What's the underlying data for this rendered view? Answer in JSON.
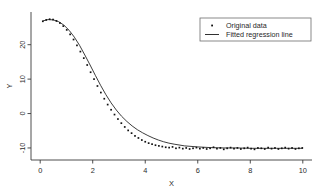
{
  "chart_data": {
    "type": "scatter",
    "title": "",
    "subtitle": "",
    "xlabel": "X",
    "ylabel": "Y",
    "xlim": [
      -0.35,
      10.35
    ],
    "ylim": [
      -13.5,
      29.5
    ],
    "xticks": [
      0,
      2,
      4,
      6,
      8,
      10
    ],
    "xticklabels": [
      "0",
      "2",
      "4",
      "6",
      "8",
      "10"
    ],
    "yticks": [
      -10,
      0,
      10,
      20
    ],
    "yticklabels": [
      "-10",
      "0",
      "10",
      "20"
    ],
    "grid": false,
    "legend_position": "top-right",
    "legend": [
      "Original data",
      "Fitted regression line"
    ],
    "series": [
      {
        "name": "Original data",
        "type": "scatter",
        "marker": "dot",
        "color": "#111111",
        "x": [
          0.1,
          0.23,
          0.36,
          0.49,
          0.62,
          0.75,
          0.88,
          1.01,
          1.14,
          1.27,
          1.4,
          1.53,
          1.66,
          1.79,
          1.92,
          2.05,
          2.18,
          2.31,
          2.44,
          2.57,
          2.7,
          2.83,
          2.96,
          3.09,
          3.22,
          3.35,
          3.48,
          3.61,
          3.74,
          3.87,
          4.0,
          4.13,
          4.26,
          4.39,
          4.52,
          4.65,
          4.78,
          4.91,
          5.04,
          5.17,
          5.3,
          5.43,
          5.56,
          5.69,
          5.82,
          5.95,
          6.08,
          6.21,
          6.34,
          6.47,
          6.6,
          6.73,
          6.86,
          6.99,
          7.12,
          7.25,
          7.38,
          7.51,
          7.64,
          7.77,
          7.9,
          8.03,
          8.16,
          8.29,
          8.42,
          8.55,
          8.68,
          8.81,
          8.94,
          9.07,
          9.2,
          9.33,
          9.46,
          9.59,
          9.72,
          9.85,
          9.98
        ],
        "y": [
          26.8,
          27.2,
          27.4,
          27.3,
          26.9,
          26.3,
          25.4,
          24.3,
          23.0,
          21.5,
          19.8,
          18.0,
          16.1,
          14.1,
          12.0,
          10.0,
          8.0,
          6.1,
          4.3,
          2.6,
          1.1,
          -0.3,
          -1.6,
          -2.8,
          -3.9,
          -4.9,
          -5.7,
          -6.5,
          -7.1,
          -7.7,
          -8.2,
          -8.6,
          -8.9,
          -9.2,
          -9.4,
          -9.6,
          -9.8,
          -9.9,
          -9.7,
          -10.1,
          -9.9,
          -10.2,
          -10.0,
          -10.3,
          -10.1,
          -9.9,
          -10.2,
          -10.0,
          -10.3,
          -10.1,
          -9.8,
          -10.2,
          -10.0,
          -10.4,
          -10.1,
          -9.9,
          -10.2,
          -10.0,
          -10.3,
          -10.1,
          -9.9,
          -10.2,
          -10.4,
          -10.0,
          -10.1,
          -10.3,
          -9.9,
          -10.2,
          -10.0,
          -10.3,
          -10.1,
          -9.9,
          -10.2,
          -10.0,
          -10.3,
          -10.1,
          -10.0
        ]
      },
      {
        "name": "Fitted regression line",
        "type": "line",
        "color": "#1a1a1a",
        "x": [
          0.1,
          0.3,
          0.5,
          0.7,
          0.9,
          1.1,
          1.3,
          1.5,
          1.7,
          1.9,
          2.1,
          2.3,
          2.5,
          2.7,
          2.9,
          3.1,
          3.3,
          3.5,
          3.7,
          3.9,
          4.1,
          4.3,
          4.5,
          4.7,
          4.9,
          5.1,
          5.5,
          6.0,
          6.5,
          7.0,
          7.5,
          8.0,
          8.5,
          9.0,
          9.5,
          10.0
        ],
        "y": [
          26.9,
          27.3,
          27.2,
          26.7,
          25.7,
          24.2,
          22.2,
          19.8,
          17.0,
          14.1,
          11.1,
          8.2,
          5.5,
          3.1,
          1.0,
          -0.8,
          -2.3,
          -3.6,
          -4.7,
          -5.6,
          -6.4,
          -7.1,
          -7.7,
          -8.2,
          -8.6,
          -8.9,
          -9.4,
          -9.7,
          -9.9,
          -10.0,
          -10.0,
          -10.1,
          -10.1,
          -10.1,
          -10.1,
          -10.1
        ]
      }
    ]
  }
}
